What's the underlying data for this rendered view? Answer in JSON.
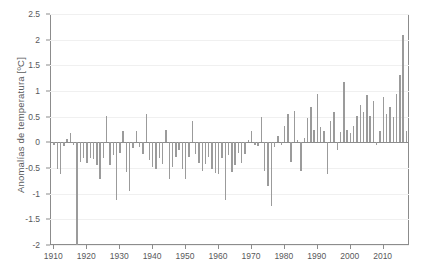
{
  "chart_data": {
    "type": "bar",
    "title": "",
    "subtitle": "",
    "xlabel": "",
    "ylabel": "Anomalías de temperatura [ºC]",
    "xlim": [
      1909,
      2018
    ],
    "ylim": [
      -2,
      2.5
    ],
    "grid": true,
    "legend": null,
    "annotations": [],
    "yticks": [
      2.5,
      2,
      1.5,
      1,
      0.5,
      0,
      -0.5,
      -1,
      -1.5,
      -2
    ],
    "ytick_labels": [
      "2.5",
      "2",
      "1.5",
      "1",
      "0.5",
      "0",
      "-0.5",
      "-1",
      "-1.5",
      "-2"
    ],
    "xticks": [
      1910,
      1920,
      1930,
      1940,
      1950,
      1960,
      1970,
      1980,
      1990,
      2000,
      2010
    ],
    "xtick_labels": [
      "1910",
      "1920",
      "1930",
      "1940",
      "1950",
      "1960",
      "1970",
      "1980",
      "1990",
      "2000",
      "2010"
    ],
    "bar_color": "#9b9b9b",
    "axis_color": "#8c8c8c",
    "grid_color": "#f0f0f0",
    "text_color": "#58595b",
    "x": [
      1910,
      1911,
      1912,
      1913,
      1914,
      1915,
      1916,
      1917,
      1918,
      1919,
      1920,
      1921,
      1922,
      1923,
      1924,
      1925,
      1926,
      1927,
      1928,
      1929,
      1930,
      1931,
      1932,
      1933,
      1934,
      1935,
      1936,
      1937,
      1938,
      1939,
      1940,
      1941,
      1942,
      1943,
      1944,
      1945,
      1946,
      1947,
      1948,
      1949,
      1950,
      1951,
      1952,
      1953,
      1954,
      1955,
      1956,
      1957,
      1958,
      1959,
      1960,
      1961,
      1962,
      1963,
      1964,
      1965,
      1966,
      1967,
      1968,
      1969,
      1970,
      1971,
      1972,
      1973,
      1974,
      1975,
      1976,
      1977,
      1978,
      1979,
      1980,
      1981,
      1982,
      1983,
      1984,
      1985,
      1986,
      1987,
      1988,
      1989,
      1990,
      1991,
      1992,
      1993,
      1994,
      1995,
      1996,
      1997,
      1998,
      1999,
      2000,
      2001,
      2002,
      2003,
      2004,
      2005,
      2006,
      2007,
      2008,
      2009,
      2010,
      2011,
      2012,
      2013,
      2014,
      2015,
      2016,
      2017
    ],
    "values": [
      -0.05,
      -0.52,
      -0.62,
      -0.07,
      0.07,
      0.18,
      -0.06,
      -2.0,
      -0.38,
      -0.3,
      -0.4,
      -0.3,
      -0.33,
      -0.45,
      -0.72,
      -0.3,
      0.52,
      -0.45,
      -0.25,
      -1.12,
      -0.2,
      0.22,
      -0.58,
      -0.95,
      -0.12,
      0.22,
      -0.1,
      -0.22,
      0.55,
      -0.35,
      -0.48,
      -0.52,
      -0.3,
      -0.42,
      0.25,
      -0.72,
      -0.48,
      -0.28,
      -0.15,
      -0.52,
      -0.72,
      -0.28,
      0.42,
      -0.22,
      -0.4,
      -0.55,
      -0.42,
      -0.28,
      -0.52,
      -0.6,
      -0.62,
      -0.3,
      -1.12,
      -0.25,
      -0.58,
      -0.45,
      -0.2,
      -0.4,
      -0.22,
      0.05,
      0.22,
      -0.05,
      -0.08,
      0.5,
      -0.55,
      -0.85,
      -1.25,
      -0.1,
      0.12,
      -0.05,
      0.32,
      0.55,
      -0.38,
      0.62,
      0.05,
      -0.55,
      0.08,
      0.48,
      0.68,
      0.25,
      0.95,
      0.3,
      0.22,
      -0.62,
      0.42,
      0.6,
      -0.15,
      0.2,
      1.18,
      0.25,
      0.18,
      0.32,
      0.52,
      0.72,
      0.6,
      0.92,
      0.52,
      0.8,
      -0.05,
      0.22,
      0.88,
      0.55,
      0.68,
      0.5,
      0.95,
      1.32,
      2.1,
      0.22
    ]
  }
}
